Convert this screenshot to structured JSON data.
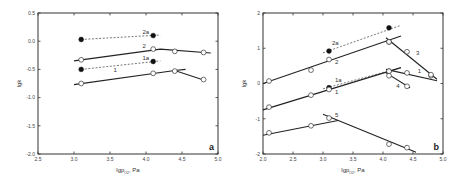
{
  "chart_data": [
    {
      "type": "line",
      "panel": "a",
      "title": "",
      "xlabel": "lgp",
      "xlabel_sub": "O2",
      "xlabel_unit": ", Pa",
      "ylabel": "lgk",
      "xlim": [
        2.5,
        5.0
      ],
      "ylim": [
        -2.0,
        0.5
      ],
      "xticks": [
        2.5,
        3.0,
        3.5,
        4.0,
        4.5,
        5.0
      ],
      "xtick_labels": [
        "2.5",
        "3.0",
        "3.5",
        "4.0",
        "4.5",
        "5.0"
      ],
      "yticks": [
        0.5,
        0.0,
        -0.5,
        -1.0,
        -1.5,
        -2.0
      ],
      "ytick_labels": [
        "0.5",
        "0.0",
        "-0.5",
        "-1.0",
        "-1.5",
        "-2.0"
      ],
      "grid": false,
      "series": [
        {
          "name": "2a",
          "marker": "filled",
          "line": "dashed",
          "points": [
            [
              3.1,
              0.03
            ],
            [
              4.1,
              0.1
            ]
          ],
          "fit": [
            [
              3.1,
              0.03
            ],
            [
              4.2,
              0.11
            ]
          ],
          "label_at": [
            3.95,
            0.13
          ]
        },
        {
          "name": "2",
          "marker": "open",
          "line": "solid",
          "points": [
            [
              3.1,
              -0.33
            ],
            [
              4.1,
              -0.14
            ],
            [
              4.4,
              -0.18
            ],
            [
              4.8,
              -0.2
            ]
          ],
          "fit": [
            [
              3.0,
              -0.35
            ],
            [
              4.2,
              -0.14
            ],
            [
              4.9,
              -0.21
            ]
          ],
          "label_at": [
            3.95,
            -0.12
          ]
        },
        {
          "name": "1a",
          "marker": "filled",
          "line": "dashed",
          "points": [
            [
              3.1,
              -0.5
            ],
            [
              4.1,
              -0.36
            ]
          ],
          "fit": [
            [
              3.1,
              -0.5
            ],
            [
              4.2,
              -0.35
            ]
          ],
          "label_at": [
            3.95,
            -0.33
          ]
        },
        {
          "name": "1",
          "marker": "open",
          "line": "solid",
          "points": [
            [
              3.1,
              -0.75
            ],
            [
              4.1,
              -0.57
            ],
            [
              4.4,
              -0.53
            ],
            [
              4.8,
              -0.68
            ]
          ],
          "fit": [
            [
              3.0,
              -0.77
            ],
            [
              4.4,
              -0.52
            ],
            [
              4.8,
              -0.69
            ]
          ],
          "fit2": [
            [
              4.4,
              -0.52
            ],
            [
              4.55,
              -0.5
            ]
          ],
          "label_at": [
            3.55,
            -0.54
          ]
        }
      ]
    },
    {
      "type": "line",
      "panel": "b",
      "title": "",
      "xlabel": "lgp",
      "xlabel_sub": "O2",
      "xlabel_unit": ", Pa",
      "ylabel": "lgk",
      "xlim": [
        2.0,
        5.0
      ],
      "ylim": [
        -2,
        2
      ],
      "xticks": [
        2.0,
        2.5,
        3.0,
        3.5,
        4.0,
        4.5,
        5.0
      ],
      "xtick_labels": [
        "2.0",
        "2.5",
        "3.0",
        "3.5",
        "4.0",
        "4.5",
        "5.0"
      ],
      "yticks": [
        2,
        1,
        0,
        -1,
        -2
      ],
      "ytick_labels": [
        "2",
        "1",
        "0",
        "-1",
        "-2"
      ],
      "grid": false,
      "series": [
        {
          "name": "2a",
          "marker": "filled",
          "line": "dashed",
          "points": [
            [
              3.1,
              0.92
            ],
            [
              4.1,
              1.58
            ]
          ],
          "fit": [
            [
              3.0,
              0.87
            ],
            [
              4.3,
              1.65
            ]
          ],
          "label_at": [
            3.15,
            1.1
          ]
        },
        {
          "name": "2",
          "marker": "open",
          "line": "solid",
          "points": [
            [
              2.1,
              0.07
            ],
            [
              2.8,
              0.38
            ],
            [
              3.1,
              0.68
            ],
            [
              4.1,
              1.18
            ]
          ],
          "fit": [
            [
              2.0,
              0.0
            ],
            [
              4.3,
              1.35
            ]
          ],
          "label_at": [
            3.2,
            0.55
          ]
        },
        {
          "name": "3",
          "marker": "open",
          "line": "solid",
          "points": [
            [
              4.1,
              1.18
            ],
            [
              4.4,
              0.9
            ],
            [
              4.8,
              0.22
            ]
          ],
          "fit": [
            [
              4.05,
              1.3
            ],
            [
              4.9,
              0.12
            ]
          ],
          "label_at": [
            4.55,
            0.8
          ]
        },
        {
          "name": "1a",
          "marker": "filled",
          "line": "dashed",
          "points": [
            [
              3.1,
              -0.12
            ],
            [
              4.1,
              0.35
            ]
          ],
          "fit": [
            [
              3.0,
              -0.15
            ],
            [
              4.3,
              0.45
            ]
          ],
          "label_at": [
            3.2,
            0.05
          ]
        },
        {
          "name": "1",
          "marker": "open",
          "line": "solid",
          "points": [
            [
              2.1,
              -0.67
            ],
            [
              2.8,
              -0.33
            ],
            [
              3.1,
              -0.17
            ],
            [
              4.1,
              0.35
            ],
            [
              4.4,
              0.3
            ],
            [
              4.8,
              0.25
            ]
          ],
          "fit": [
            [
              2.0,
              -0.75
            ],
            [
              4.3,
              0.45
            ]
          ],
          "fit2": [
            [
              4.05,
              0.4
            ],
            [
              4.9,
              0.08
            ]
          ],
          "label_at": [
            3.2,
            -0.3
          ],
          "label2_at": [
            4.58,
            0.3
          ]
        },
        {
          "name": "4",
          "marker": "open",
          "line": "solid",
          "points": [
            [
              4.1,
              0.22
            ],
            [
              4.4,
              -0.08
            ]
          ],
          "fit": [
            [
              4.05,
              0.3
            ],
            [
              4.45,
              -0.12
            ]
          ],
          "label_at": [
            4.22,
            -0.12
          ]
        },
        {
          "name": "5",
          "marker": "open",
          "line": "solid",
          "points": [
            [
              2.1,
              -1.4
            ],
            [
              2.8,
              -1.2
            ],
            [
              3.1,
              -0.98
            ],
            [
              4.1,
              -1.72
            ],
            [
              4.4,
              -1.82
            ]
          ],
          "fit": [
            [
              2.0,
              -1.47
            ],
            [
              3.25,
              -1.05
            ]
          ],
          "fit2": [
            [
              3.0,
              -0.87
            ],
            [
              4.55,
              -1.95
            ]
          ],
          "label_at": [
            3.2,
            -0.95
          ]
        }
      ]
    }
  ]
}
